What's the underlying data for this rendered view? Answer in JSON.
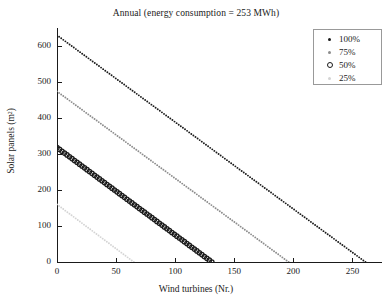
{
  "chart_data": {
    "type": "line",
    "title": "Annual (energy consumption = 253 MWh)",
    "xlabel": "Wind turbines (Nr.)",
    "ylabel": "Solar panels (m²)",
    "xlim": [
      0,
      275
    ],
    "ylim": [
      0,
      650
    ],
    "xticks": [
      0,
      50,
      100,
      150,
      200,
      250
    ],
    "yticks": [
      0,
      100,
      200,
      300,
      400,
      500,
      600
    ],
    "xtick_labels": [
      "0",
      "50",
      "100",
      "150",
      "200",
      "250"
    ],
    "ytick_labels": [
      "0",
      "100",
      "200",
      "300",
      "400",
      "500",
      "600"
    ],
    "grid": false,
    "legend_position": "top-right",
    "series": [
      {
        "name": "100%",
        "color": "#1a1a1a",
        "marker": "dot",
        "x": [
          0,
          261
        ],
        "y": [
          630,
          0
        ]
      },
      {
        "name": "75%",
        "color": "#8c8c8c",
        "marker": "dot",
        "x": [
          0,
          196
        ],
        "y": [
          474,
          0
        ]
      },
      {
        "name": "50%",
        "color": "#1a1a1a",
        "marker": "circle",
        "x": [
          0,
          131
        ],
        "y": [
          318,
          0
        ]
      },
      {
        "name": "25%",
        "color": "#d4d4d4",
        "marker": "dot",
        "x": [
          0,
          65
        ],
        "y": [
          160,
          0
        ]
      }
    ]
  },
  "legend": {
    "entries": [
      {
        "label": "100%"
      },
      {
        "label": "75%"
      },
      {
        "label": "50%"
      },
      {
        "label": "25%"
      }
    ]
  }
}
